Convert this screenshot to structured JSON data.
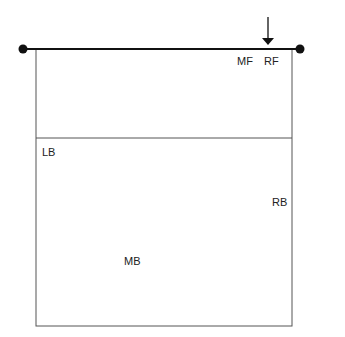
{
  "diagram": {
    "type": "volleyball-court-half",
    "net": {
      "left_post": "post-dot",
      "right_post": "post-dot"
    },
    "arrow": {
      "meaning": "serve-receive-direction",
      "points_to": "RF"
    },
    "positions": [
      {
        "id": "MF",
        "label": "MF"
      },
      {
        "id": "RF",
        "label": "RF"
      },
      {
        "id": "LB",
        "label": "LB"
      },
      {
        "id": "RB",
        "label": "RB"
      },
      {
        "id": "MB",
        "label": "MB"
      }
    ]
  }
}
